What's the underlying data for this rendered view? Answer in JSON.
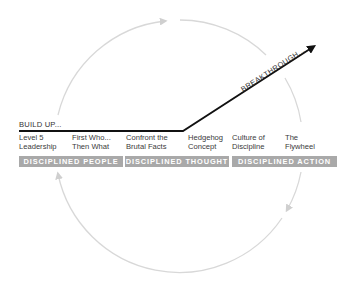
{
  "diagram": {
    "build_up_label": "BUILD UP...",
    "breakthrough_label": "BREAKTHROUGH...",
    "steps": [
      {
        "line1": "Level 5",
        "line2": "Leadership"
      },
      {
        "line1": "First Who...",
        "line2": "Then What"
      },
      {
        "line1": "Confront the",
        "line2": "Brutal Facts"
      },
      {
        "line1": "Hedgehog",
        "line2": "Concept"
      },
      {
        "line1": "Culture of",
        "line2": "Discipline"
      },
      {
        "line1": "The",
        "line2": "Flywheel"
      }
    ],
    "stages": [
      {
        "label": "DISCIPLINED PEOPLE"
      },
      {
        "label": "DISCIPLINED THOUGHT"
      },
      {
        "label": "DISCIPLINED ACTION"
      }
    ],
    "colors": {
      "band": "#a9a9a9",
      "circle": "#d9d9d9",
      "line": "#111111"
    }
  }
}
